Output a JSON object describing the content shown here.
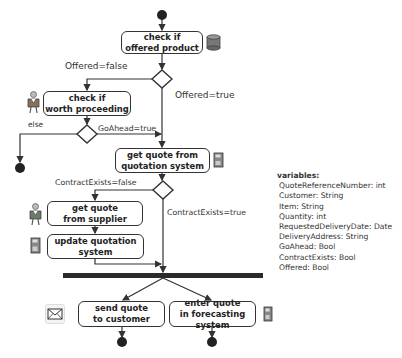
{
  "activities": {
    "check_offered": "check if\noffered product",
    "check_worth": "check if\nworth proceeding",
    "get_quote_system": "get quote from\nquotation system",
    "get_quote_supplier": "get quote\nfrom supplier",
    "update_system": "update quotation system",
    "send_quote": "send quote\nto customer",
    "enter_forecast": "enter quote\nin forecasting system"
  },
  "guards": {
    "offered_false": "Offered=false",
    "offered_true": "Offered=true",
    "else": "else",
    "goahead_true": "GoAhead=true",
    "contract_false": "ContractExists=false",
    "contract_true": "ContractExists=true"
  },
  "variables": {
    "title": "variables:",
    "items": [
      "QuoteReferenceNumber: int",
      "Customer: String",
      "Item: String",
      "Quantity: int",
      "RequestedDeliveryDate: Date",
      "DeliveryAddress: String",
      "GoAhead: Bool",
      "ContractExists: Bool",
      "Offered: Bool"
    ]
  },
  "icons": {
    "database": "database-icon",
    "person": "person-icon",
    "computer": "computer-icon",
    "envelope": "envelope-icon"
  },
  "colors": {
    "line": "#333333",
    "node": "#222222",
    "sync_bar": "#2a2a2a"
  }
}
